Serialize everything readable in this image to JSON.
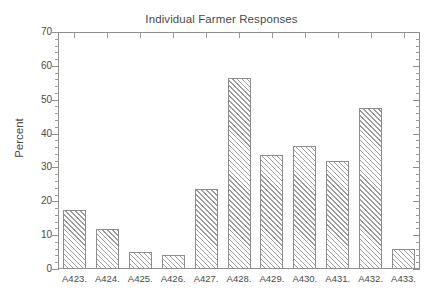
{
  "chart_data": {
    "type": "bar",
    "title": "Individual Farmer Responses",
    "xlabel": "",
    "ylabel": "Percent",
    "ylim": [
      0,
      70
    ],
    "ytick_labels": [
      "0",
      "10",
      "20",
      "30",
      "40",
      "50",
      "60",
      "70"
    ],
    "ytick_values": [
      0,
      10,
      20,
      30,
      40,
      50,
      60,
      70
    ],
    "grid": false,
    "legend": false,
    "legend_position": "none",
    "categories": [
      "A423.",
      "A424.",
      "A425.",
      "A426.",
      "A427.",
      "A428.",
      "A429.",
      "A430.",
      "A431.",
      "A432.",
      "A433."
    ],
    "values": [
      17.5,
      11.8,
      5.1,
      4.2,
      23.5,
      56.4,
      33.7,
      36.2,
      31.8,
      47.5,
      5.9
    ],
    "bar_style": {
      "fill": "diagonal-hatch",
      "fill_color": "#ffffff",
      "hatch_color": "#9d9d9d",
      "edge_color": "#8d8d8d"
    }
  },
  "style": {
    "background": "#ffffff",
    "axis_color": "#8f8f8f",
    "text_color": "#4a4a4a"
  }
}
